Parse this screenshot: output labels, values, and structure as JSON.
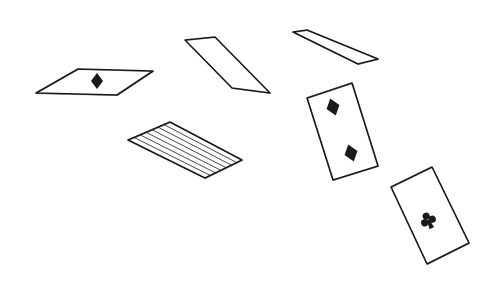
{
  "illustration": {
    "title": "Sketch of falling playing cards",
    "style": "hand-drawn ink sketch",
    "ink_color": "#1a1a1a",
    "background": "#ffffff",
    "cards": [
      {
        "id": "card-diamond-flat",
        "face": "ace",
        "suit": "diamond",
        "corners": [
          [
            36,
            93
          ],
          [
            78,
            69
          ],
          [
            153,
            71
          ],
          [
            117,
            95
          ]
        ],
        "pips": [
          {
            "suit": "diamond",
            "x": 97,
            "y": 81,
            "size": 8,
            "rot": 0
          }
        ]
      },
      {
        "id": "card-blank-edge-left",
        "face": "blank",
        "suit": "none",
        "corners": [
          [
            185,
            40
          ],
          [
            215,
            37
          ],
          [
            270,
            93
          ],
          [
            232,
            88
          ]
        ],
        "pips": []
      },
      {
        "id": "card-blank-edge-right",
        "face": "blank",
        "suit": "none",
        "corners": [
          [
            293,
            32
          ],
          [
            307,
            30
          ],
          [
            378,
            59
          ],
          [
            358,
            64
          ]
        ],
        "pips": []
      },
      {
        "id": "card-back-striped",
        "face": "back",
        "suit": "none",
        "corners": [
          [
            128,
            140
          ],
          [
            170,
            122
          ],
          [
            242,
            160
          ],
          [
            205,
            178
          ]
        ],
        "pips": []
      },
      {
        "id": "card-two-of-diamonds",
        "face": "two",
        "suit": "diamond",
        "corners": [
          [
            307,
            98
          ],
          [
            352,
            83
          ],
          [
            378,
            166
          ],
          [
            333,
            180
          ]
        ],
        "pips": [
          {
            "suit": "diamond",
            "x": 333,
            "y": 107,
            "size": 9,
            "rot": -18
          },
          {
            "suit": "diamond",
            "x": 351,
            "y": 153,
            "size": 9,
            "rot": -18
          }
        ]
      },
      {
        "id": "card-ace-of-clubs",
        "face": "ace",
        "suit": "club",
        "corners": [
          [
            391,
            187
          ],
          [
            432,
            167
          ],
          [
            469,
            243
          ],
          [
            427,
            264
          ]
        ],
        "pips": [
          {
            "suit": "club",
            "x": 428,
            "y": 220,
            "size": 10,
            "rot": -25
          }
        ]
      }
    ]
  }
}
